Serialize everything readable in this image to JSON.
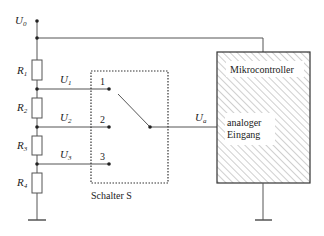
{
  "diagram": {
    "supply_label": "U",
    "supply_sub": "0",
    "resistors": [
      {
        "label": "R",
        "sub": "1"
      },
      {
        "label": "R",
        "sub": "2"
      },
      {
        "label": "R",
        "sub": "3"
      },
      {
        "label": "R",
        "sub": "4"
      }
    ],
    "taps": [
      {
        "label": "U",
        "sub": "1",
        "position": "1"
      },
      {
        "label": "U",
        "sub": "2",
        "position": "2"
      },
      {
        "label": "U",
        "sub": "3",
        "position": "3"
      }
    ],
    "switch_label": "Schalter S",
    "output_label": "U",
    "output_sub": "a",
    "mcu": {
      "title": "Mikrocontroller",
      "input_line1": "analoger",
      "input_line2": "Eingang"
    },
    "colors": {
      "line": "#555555",
      "text": "#222222",
      "hatch": "#888888"
    }
  }
}
